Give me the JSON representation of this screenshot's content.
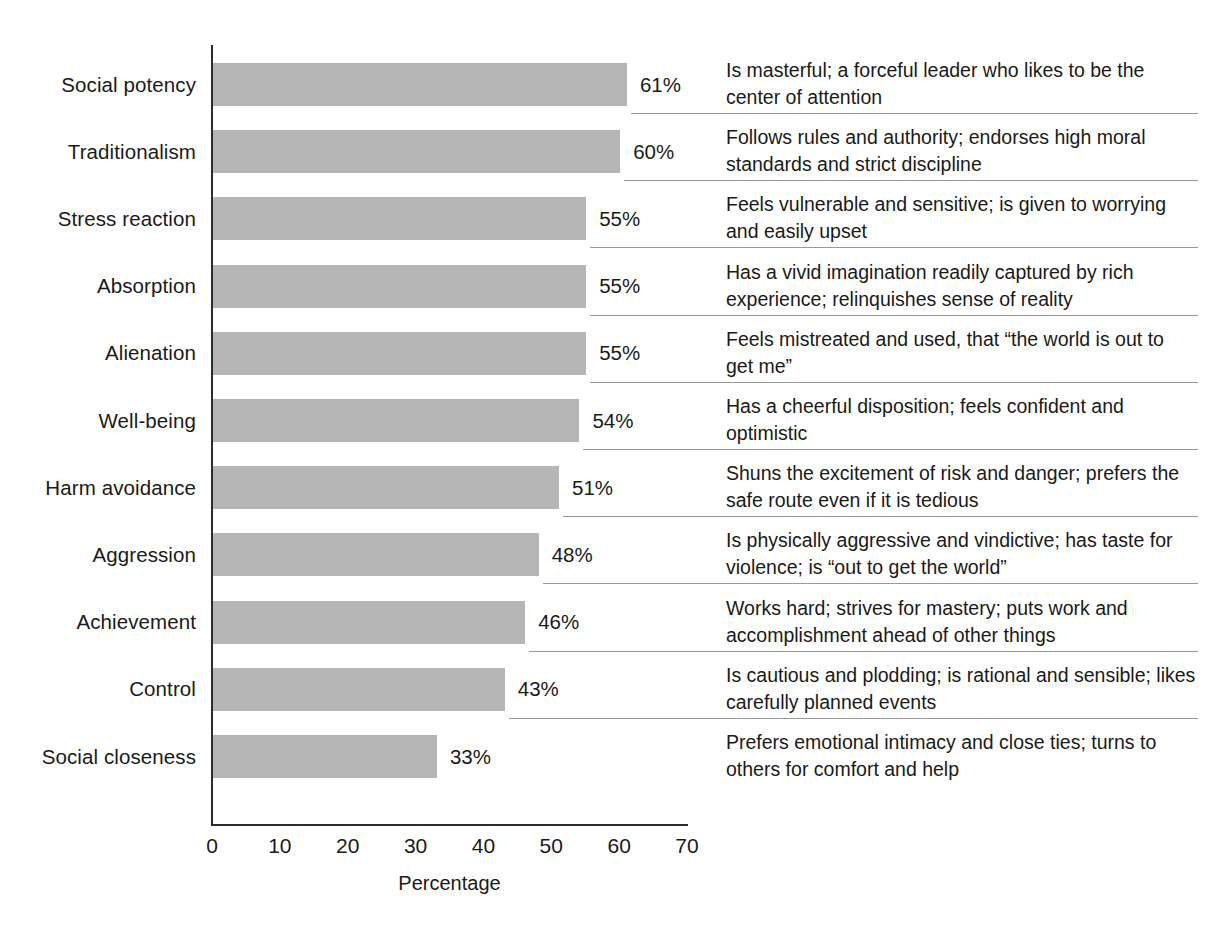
{
  "chart_data": {
    "type": "bar",
    "orientation": "horizontal",
    "title": "",
    "xlabel": "Percentage",
    "ylabel": "",
    "xlim": [
      0,
      70
    ],
    "xticks": [
      0,
      10,
      20,
      30,
      40,
      50,
      60,
      70
    ],
    "grid": false,
    "legend": null,
    "bar_color": "#b6b6b6",
    "value_suffix": "%",
    "categories": [
      "Social potency",
      "Traditionalism",
      "Stress reaction",
      "Absorption",
      "Alienation",
      "Well-being",
      "Harm avoidance",
      "Aggression",
      "Achievement",
      "Control",
      "Social closeness"
    ],
    "values": [
      61,
      60,
      55,
      55,
      55,
      54,
      51,
      48,
      46,
      43,
      33
    ],
    "value_labels": [
      "61%",
      "60%",
      "55%",
      "55%",
      "55%",
      "54%",
      "51%",
      "48%",
      "46%",
      "43%",
      "33%"
    ],
    "annotations": [
      "Is masterful; a forceful leader who likes to be the center of attention",
      "Follows rules and authority; endorses high moral standards and strict discipline",
      "Feels vulnerable and sensitive; is given to worrying and easily upset",
      "Has a vivid imagination readily captured by rich experience; relinquishes sense of reality",
      "Feels mistreated and used, that “the world is out to get me”",
      "Has a cheerful disposition; feels confident and optimistic",
      "Shuns the excitement of risk and danger; prefers the safe route even if it is tedious",
      "Is physically aggressive and vindictive; has taste for violence; is “out to get the world”",
      "Works hard; strives for mastery; puts work and accomplishment ahead of other things",
      "Is cautious and plodding; is rational and sensible; likes carefully planned events",
      "Prefers emotional intimacy and close ties; turns to others for comfort and help"
    ]
  }
}
